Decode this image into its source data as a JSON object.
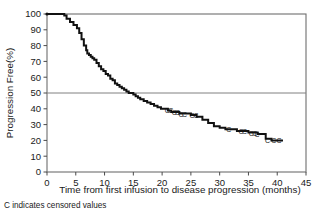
{
  "figure": {
    "caption": "C indicates censored values",
    "censor_glyph": "C"
  },
  "chart_data": {
    "type": "line",
    "title": "",
    "xlabel": "Time from first infusion to disease progression (months)",
    "ylabel": "Progression Free(%)",
    "xlim": [
      0,
      45
    ],
    "ylim": [
      0,
      100
    ],
    "xticks": [
      0,
      5,
      10,
      15,
      20,
      25,
      30,
      35,
      40,
      45
    ],
    "yticks": [
      0,
      10,
      20,
      30,
      40,
      50,
      60,
      70,
      80,
      90,
      100
    ],
    "grid": false,
    "legend": null,
    "reference_lines": [
      {
        "axis": "y",
        "value": 50,
        "color": "#808080",
        "note": "median reference line at 50%"
      }
    ],
    "series": [
      {
        "name": "Progression-free survival",
        "style": "kaplan-meier-step",
        "color": "#111111",
        "x": [
          0,
          1.0,
          2.0,
          3.0,
          3.4,
          4.0,
          4.6,
          5.2,
          5.6,
          6.0,
          6.4,
          6.8,
          7.0,
          7.3,
          7.6,
          7.9,
          8.2,
          8.6,
          9.0,
          9.4,
          9.8,
          10.2,
          10.6,
          11.0,
          11.4,
          11.8,
          12.2,
          12.6,
          13.0,
          13.4,
          13.8,
          14.2,
          14.6,
          15.0,
          15.4,
          15.8,
          16.2,
          16.8,
          17.4,
          18.0,
          18.6,
          19.2,
          19.8,
          20.4,
          21.0,
          21.6,
          22.2,
          23.0,
          24.0,
          25.0,
          26.0,
          27.0,
          28.0,
          29.0,
          30.0,
          31.0,
          32.0,
          33.0,
          34.0,
          35.0,
          36.0,
          36.6,
          37.2,
          38.0,
          39.0,
          40.0,
          41.0
        ],
        "y": [
          100,
          100,
          100,
          99,
          97,
          95,
          93,
          91,
          88,
          84,
          80,
          77,
          75,
          74,
          73,
          72,
          71,
          69,
          67,
          65,
          64,
          62,
          61,
          59,
          58,
          56,
          55,
          54,
          53,
          52,
          51,
          50,
          50,
          49,
          48,
          47,
          46,
          45,
          44,
          43,
          42,
          41,
          40,
          40,
          39,
          38,
          38,
          37,
          37,
          36,
          35,
          33,
          31,
          29,
          28,
          27,
          27,
          26,
          26,
          25,
          25,
          24,
          24,
          21,
          20,
          20,
          20
        ]
      }
    ],
    "censored": [
      {
        "x": 20.9,
        "y": 39
      },
      {
        "x": 21.5,
        "y": 39
      },
      {
        "x": 22.1,
        "y": 38
      },
      {
        "x": 22.7,
        "y": 38
      },
      {
        "x": 23.3,
        "y": 37
      },
      {
        "x": 23.9,
        "y": 37
      },
      {
        "x": 25.2,
        "y": 36
      },
      {
        "x": 25.9,
        "y": 36
      },
      {
        "x": 31.6,
        "y": 27
      },
      {
        "x": 33.7,
        "y": 26
      },
      {
        "x": 34.3,
        "y": 26
      },
      {
        "x": 35.5,
        "y": 25
      },
      {
        "x": 36.1,
        "y": 25
      },
      {
        "x": 36.5,
        "y": 24
      },
      {
        "x": 38.3,
        "y": 20
      },
      {
        "x": 39.4,
        "y": 20
      },
      {
        "x": 40.3,
        "y": 20
      }
    ]
  }
}
